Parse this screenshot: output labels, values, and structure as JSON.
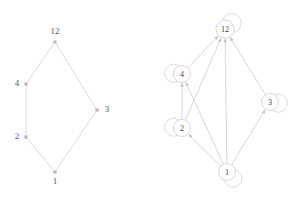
{
  "figure": {
    "title": "",
    "background_color": "#ffffff",
    "panels": [
      {
        "id": "left",
        "name": "undirected-cycle-graph",
        "graph_type": "undirected",
        "node_style": "square-dot",
        "nodes": [
          {
            "id": "12",
            "label": "12",
            "x": 55,
            "y": 42,
            "label_dx": 0,
            "label_dy": -8,
            "label_anchor": "middle",
            "self_loop": false
          },
          {
            "id": "4",
            "label": "4",
            "x": 26,
            "y": 84,
            "label_dx": -9,
            "label_dy": 2,
            "label_anchor": "middle",
            "self_loop": false
          },
          {
            "id": "2",
            "label": "2",
            "x": 26,
            "y": 137,
            "label_dx": -9,
            "label_dy": 2,
            "label_anchor": "middle",
            "self_loop": false
          },
          {
            "id": "1",
            "label": "1",
            "x": 55,
            "y": 172,
            "label_dx": 0,
            "label_dy": 12,
            "label_anchor": "middle",
            "self_loop": false
          },
          {
            "id": "3",
            "label": "3",
            "x": 97,
            "y": 110,
            "label_dx": 10,
            "label_dy": 2,
            "label_anchor": "middle",
            "self_loop": false
          }
        ],
        "edges": [
          {
            "from": "12",
            "to": "4",
            "directed": false
          },
          {
            "from": "4",
            "to": "2",
            "directed": false
          },
          {
            "from": "2",
            "to": "1",
            "directed": false
          },
          {
            "from": "1",
            "to": "3",
            "directed": false
          },
          {
            "from": "3",
            "to": "12",
            "directed": false
          }
        ]
      },
      {
        "id": "right",
        "name": "directed-graph-with-self-loops",
        "graph_type": "directed",
        "node_style": "circle-outline",
        "nodes": [
          {
            "id": "12",
            "label": "12",
            "x": 75,
            "y": 29,
            "r": 9,
            "self_loop": true,
            "loop_dir": "up-right"
          },
          {
            "id": "4",
            "label": "4",
            "x": 32,
            "y": 74,
            "r": 8.5,
            "self_loop": true,
            "loop_dir": "left"
          },
          {
            "id": "2",
            "label": "2",
            "x": 32,
            "y": 128,
            "r": 8.5,
            "self_loop": true,
            "loop_dir": "left"
          },
          {
            "id": "3",
            "label": "3",
            "x": 120,
            "y": 102,
            "r": 8.5,
            "self_loop": true,
            "loop_dir": "right"
          },
          {
            "id": "1",
            "label": "1",
            "x": 77,
            "y": 172,
            "r": 8.5,
            "self_loop": true,
            "loop_dir": "down-right"
          }
        ],
        "edges": [
          {
            "from": "2",
            "to": "4",
            "directed": true
          },
          {
            "from": "4",
            "to": "12",
            "directed": true
          },
          {
            "from": "2",
            "to": "12",
            "directed": true
          },
          {
            "from": "1",
            "to": "12",
            "directed": true
          },
          {
            "from": "3",
            "to": "12",
            "directed": true
          },
          {
            "from": "1",
            "to": "4",
            "directed": true
          },
          {
            "from": "1",
            "to": "2",
            "directed": true
          },
          {
            "from": "1",
            "to": "3",
            "directed": true
          }
        ]
      }
    ]
  },
  "chart_data": {
    "type": "diagram",
    "subtype": "graph-pair",
    "title": "",
    "panel_left": {
      "name": "undirected cycle graph",
      "node_labels": [
        "12",
        "4",
        "2",
        "1",
        "3"
      ],
      "edge_list": [
        [
          "12",
          "4"
        ],
        [
          "4",
          "2"
        ],
        [
          "2",
          "1"
        ],
        [
          "1",
          "3"
        ],
        [
          "3",
          "12"
        ]
      ],
      "edge_count": 5,
      "self_loops": 0,
      "directed": false
    },
    "panel_right": {
      "name": "directed graph with self loops",
      "node_labels": [
        "12",
        "4",
        "2",
        "3",
        "1"
      ],
      "edge_list": [
        [
          "2",
          "4"
        ],
        [
          "4",
          "12"
        ],
        [
          "2",
          "12"
        ],
        [
          "1",
          "12"
        ],
        [
          "3",
          "12"
        ],
        [
          "1",
          "4"
        ],
        [
          "1",
          "2"
        ],
        [
          "1",
          "3"
        ]
      ],
      "edge_count": 8,
      "self_loops": 5,
      "self_loop_nodes": [
        "12",
        "4",
        "2",
        "3",
        "1"
      ],
      "directed": true,
      "in_degree": {
        "12": 4,
        "4": 2,
        "2": 1,
        "3": 1,
        "1": 0
      },
      "out_degree": {
        "12": 0,
        "4": 1,
        "2": 2,
        "3": 1,
        "1": 4
      }
    },
    "xlabel": "",
    "ylabel": "",
    "legend": []
  }
}
